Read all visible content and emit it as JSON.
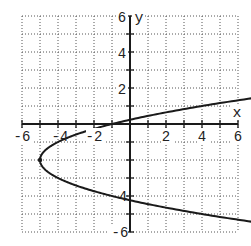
{
  "chart_data": {
    "type": "line",
    "title": "",
    "xlabel": "x",
    "ylabel": "y",
    "xlim": [
      -6,
      6
    ],
    "ylim": [
      -6,
      6
    ],
    "grid": true,
    "grid_style": "dotted",
    "x_ticks": [
      -6,
      -4,
      -2,
      2,
      4,
      6
    ],
    "y_ticks": [
      6,
      4,
      2,
      -4,
      -6
    ],
    "x_tick_labels": [
      "-6",
      "-4",
      "-2",
      "2",
      "4",
      "6"
    ],
    "y_tick_labels": [
      "6",
      "4",
      "2",
      "4",
      "-6"
    ],
    "series": [
      {
        "name": "x = y^2 + 4y - 1",
        "equation": "x = (y + 2)^2 - 5",
        "vertex": [
          -5,
          -2
        ],
        "points": [
          {
            "y": 1.32,
            "x": 6
          },
          {
            "y": 1,
            "x": 4
          },
          {
            "y": 0.236,
            "x": 0
          },
          {
            "y": 0,
            "x": -1
          },
          {
            "y": -1,
            "x": -4
          },
          {
            "y": -2,
            "x": -5
          },
          {
            "y": -3,
            "x": -4
          },
          {
            "y": -4,
            "x": -1
          },
          {
            "y": -4.236,
            "x": 0
          },
          {
            "y": -5,
            "x": 4
          },
          {
            "y": -5.32,
            "x": 6
          }
        ]
      }
    ]
  },
  "labels": {
    "x_axis": "x",
    "y_axis": "y",
    "xt": [
      "-6",
      "-4",
      "-2",
      "2",
      "4",
      "6"
    ],
    "yt": [
      "6",
      "4",
      "2",
      "4",
      "-6"
    ]
  },
  "colors": {
    "curve": "#1a1a1a",
    "axis": "#1a1a1a",
    "grid": "#555555",
    "background": "#ffffff"
  }
}
